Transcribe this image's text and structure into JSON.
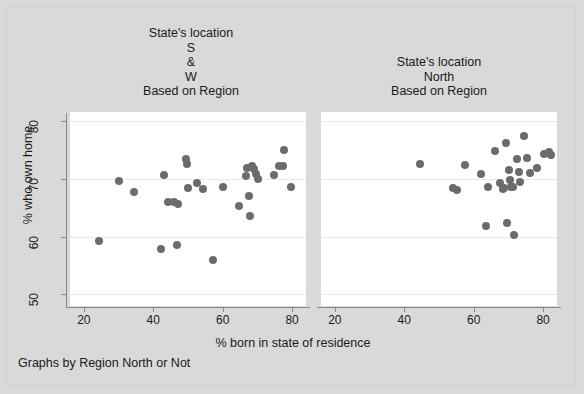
{
  "figure": {
    "ylabel": "% who own home",
    "xlabel": "% born in state of residence",
    "footnote": "Graphs by Region North or Not",
    "marker_color": "#6b6b6b",
    "background_color": "#d9d9d9",
    "panel_background_color": "#ffffff"
  },
  "panels": [
    {
      "title": "State's location\nS\n&\nW\nBased on Region",
      "xticks": [
        "20",
        "40",
        "60",
        "80"
      ],
      "yticks": [
        "80",
        "70",
        "60",
        "50"
      ]
    },
    {
      "title": "State's location\nNorth\nBased on Region",
      "xticks": [
        "20",
        "40",
        "60",
        "80"
      ],
      "yticks": [
        "80",
        "70",
        "60",
        "50"
      ]
    }
  ],
  "chart_data": {
    "type": "scatter",
    "title": "",
    "xlabel": "% born in state of residence",
    "ylabel": "% who own home",
    "xlim": [
      16,
      84
    ],
    "ylim": [
      48,
      81.5
    ],
    "xticks": [
      20,
      40,
      60,
      80
    ],
    "yticks": [
      50,
      60,
      70,
      80
    ],
    "grid": "horizontal-light",
    "legend": "none",
    "facet_by": "Region North or Not",
    "series": [
      {
        "name": "State's location S & W Based on Region",
        "panel": 0,
        "points": [
          [
            24.3,
            59.2
          ],
          [
            30.1,
            69.6
          ],
          [
            34.5,
            67.7
          ],
          [
            42.3,
            57.9
          ],
          [
            43.2,
            70.6
          ],
          [
            44.3,
            65.9
          ],
          [
            45.9,
            66.0
          ],
          [
            46.8,
            58.5
          ],
          [
            47.2,
            65.6
          ],
          [
            49.4,
            73.3
          ],
          [
            49.8,
            72.5
          ],
          [
            50.1,
            68.3
          ],
          [
            52.6,
            69.3
          ],
          [
            54.3,
            68.2
          ],
          [
            57.3,
            55.9
          ],
          [
            60.2,
            68.6
          ],
          [
            64.8,
            65.3
          ],
          [
            66.6,
            70.4
          ],
          [
            67.0,
            71.8
          ],
          [
            68.4,
            72.2
          ],
          [
            69.1,
            71.6
          ],
          [
            69.6,
            70.8
          ],
          [
            70.2,
            69.9
          ],
          [
            67.5,
            67.0
          ],
          [
            67.8,
            63.6
          ],
          [
            74.9,
            70.6
          ],
          [
            76.2,
            72.2
          ],
          [
            77.3,
            72.1
          ],
          [
            77.6,
            74.9
          ],
          [
            79.8,
            68.5
          ]
        ]
      },
      {
        "name": "State's location North Based on Region",
        "panel": 1,
        "points": [
          [
            44.6,
            72.6
          ],
          [
            53.9,
            68.3
          ],
          [
            55.2,
            68.1
          ],
          [
            57.4,
            72.3
          ],
          [
            62.2,
            70.8
          ],
          [
            63.6,
            61.9
          ],
          [
            64.0,
            68.5
          ],
          [
            66.1,
            74.7
          ],
          [
            67.5,
            69.2
          ],
          [
            68.3,
            68.2
          ],
          [
            68.8,
            68.3
          ],
          [
            69.4,
            76.1
          ],
          [
            69.6,
            62.4
          ],
          [
            70.2,
            71.4
          ],
          [
            70.5,
            69.8
          ],
          [
            70.8,
            68.6
          ],
          [
            71.3,
            68.5
          ],
          [
            71.6,
            60.2
          ],
          [
            72.4,
            73.3
          ],
          [
            73.1,
            71.2
          ],
          [
            73.4,
            69.4
          ],
          [
            74.6,
            77.4
          ],
          [
            75.4,
            73.5
          ],
          [
            76.1,
            70.9
          ],
          [
            78.2,
            71.9
          ],
          [
            80.3,
            74.2
          ],
          [
            81.8,
            74.6
          ],
          [
            82.3,
            74.1
          ]
        ]
      }
    ]
  }
}
